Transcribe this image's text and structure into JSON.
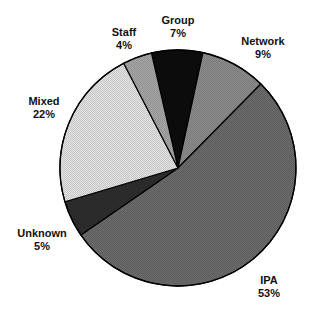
{
  "chart_data": {
    "type": "pie",
    "title": "",
    "categories": [
      "Group",
      "Network",
      "IPA",
      "Unknown",
      "Mixed",
      "Staff"
    ],
    "values": [
      7,
      9,
      53,
      5,
      22,
      4
    ],
    "unit": "%",
    "start_angle_deg": -13,
    "direction": "clockwise",
    "legend": "none (direct labels)",
    "slices": [
      {
        "label": "Group",
        "value": 7,
        "display": "7%",
        "color": "#0d0d0d"
      },
      {
        "label": "Network",
        "value": 9,
        "display": "9%",
        "color": "#8c8c8c"
      },
      {
        "label": "IPA",
        "value": 53,
        "display": "53%",
        "color": "#6b6b6b"
      },
      {
        "label": "Unknown",
        "value": 5,
        "display": "5%",
        "color": "#2e2e2e"
      },
      {
        "label": "Mixed",
        "value": 22,
        "display": "22%",
        "color": "#e3e3e3"
      },
      {
        "label": "Staff",
        "value": 4,
        "display": "4%",
        "color": "#a6a6a6"
      }
    ]
  },
  "layout": {
    "cx": 178,
    "cy": 168,
    "r": 118,
    "labels": [
      {
        "x": 178,
        "y": 14
      },
      {
        "x": 263,
        "y": 35
      },
      {
        "x": 269,
        "y": 274
      },
      {
        "x": 42,
        "y": 227
      },
      {
        "x": 44,
        "y": 95
      },
      {
        "x": 124,
        "y": 26
      }
    ]
  }
}
